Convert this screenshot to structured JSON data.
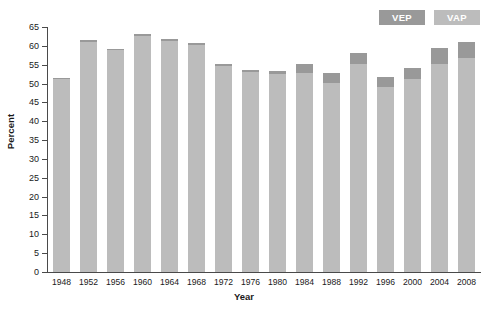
{
  "chart_data": {
    "type": "bar",
    "title": "",
    "subtitle": "",
    "xlabel": "Year",
    "ylabel": "Percent",
    "ylim": [
      0,
      65
    ],
    "ytick_values": [
      0,
      5,
      10,
      15,
      20,
      25,
      30,
      35,
      40,
      45,
      50,
      55,
      60,
      65
    ],
    "grid": false,
    "legend_position": "top-right",
    "categories": [
      "1948",
      "1952",
      "1956",
      "1960",
      "1964",
      "1968",
      "1972",
      "1976",
      "1980",
      "1984",
      "1988",
      "1992",
      "1996",
      "2000",
      "2004",
      "2008"
    ],
    "series": [
      {
        "name": "VEP",
        "color": "#999999",
        "values": [
          51.5,
          61.6,
          59.3,
          63.1,
          61.9,
          60.7,
          55.2,
          53.6,
          53.3,
          55.2,
          52.8,
          58.1,
          51.7,
          54.2,
          59.5,
          61.0
        ]
      },
      {
        "name": "VAP",
        "color": "#bcbcbc",
        "values": [
          51.1,
          61.1,
          59.0,
          62.5,
          61.4,
          60.3,
          54.7,
          53.1,
          52.6,
          52.9,
          50.1,
          55.1,
          49.0,
          51.2,
          55.3,
          56.8
        ]
      }
    ],
    "legend": [
      {
        "label": "VEP",
        "color": "#999999"
      },
      {
        "label": "VAP",
        "color": "#bcbcbc"
      }
    ]
  },
  "colors": {
    "vep": "#999999",
    "vap": "#bcbcbc",
    "axis": "#4a4a4a",
    "text": "#1a1a1a",
    "background": "#ffffff"
  }
}
